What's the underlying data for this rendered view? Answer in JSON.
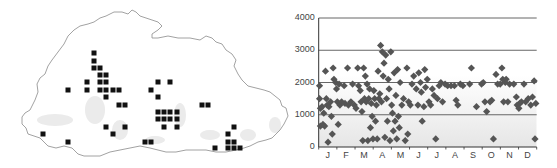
{
  "map": {
    "title": "Distribution map",
    "outline_color": "#8a8a8a",
    "square_color": "#111111",
    "square_size": 5,
    "squares": [
      [
        94,
        53
      ],
      [
        94,
        61
      ],
      [
        94,
        68
      ],
      [
        100,
        68
      ],
      [
        100,
        75
      ],
      [
        106,
        75
      ],
      [
        87,
        82
      ],
      [
        100,
        82
      ],
      [
        106,
        82
      ],
      [
        158,
        82
      ],
      [
        170,
        82
      ],
      [
        68,
        90
      ],
      [
        87,
        90
      ],
      [
        100,
        90
      ],
      [
        106,
        90
      ],
      [
        113,
        90
      ],
      [
        119,
        90
      ],
      [
        151,
        90
      ],
      [
        106,
        97
      ],
      [
        158,
        97
      ],
      [
        119,
        105
      ],
      [
        125,
        105
      ],
      [
        202,
        105
      ],
      [
        208,
        105
      ],
      [
        158,
        112
      ],
      [
        164,
        112
      ],
      [
        170,
        112
      ],
      [
        177,
        112
      ],
      [
        158,
        119
      ],
      [
        164,
        119
      ],
      [
        170,
        119
      ],
      [
        177,
        119
      ],
      [
        106,
        127
      ],
      [
        125,
        127
      ],
      [
        164,
        127
      ],
      [
        177,
        127
      ],
      [
        234,
        127
      ],
      [
        43,
        134
      ],
      [
        113,
        134
      ],
      [
        228,
        134
      ],
      [
        68,
        142
      ],
      [
        145,
        142
      ],
      [
        151,
        142
      ],
      [
        228,
        142
      ],
      [
        234,
        142
      ],
      [
        215,
        148
      ],
      [
        228,
        148
      ],
      [
        234,
        148
      ],
      [
        240,
        148
      ]
    ]
  },
  "chart_data": {
    "type": "scatter",
    "title": "",
    "xlabel": "",
    "ylabel": "",
    "ylim": [
      0,
      4000
    ],
    "yticks": [
      0,
      1000,
      2000,
      3000,
      4000
    ],
    "ytick_labels": [
      "0",
      "1000",
      "2000",
      "3000",
      "4000"
    ],
    "xticks_labels": [
      "J",
      "F",
      "M",
      "A",
      "M",
      "J",
      "J",
      "A",
      "S",
      "O",
      "N",
      "D"
    ],
    "xlim": [
      0,
      12
    ],
    "grid": "horizontal",
    "marker": "diamond",
    "marker_color": "#555555",
    "background": "white above 2000, light grey shading below 2000",
    "points": [
      [
        0.05,
        1900
      ],
      [
        0.05,
        1500
      ],
      [
        0.1,
        1200
      ],
      [
        0.1,
        650
      ],
      [
        0.2,
        1250
      ],
      [
        0.25,
        700
      ],
      [
        0.3,
        1050
      ],
      [
        0.35,
        650
      ],
      [
        0.4,
        2350
      ],
      [
        0.45,
        1500
      ],
      [
        0.5,
        1300
      ],
      [
        0.55,
        150
      ],
      [
        0.6,
        1250
      ],
      [
        0.7,
        1400
      ],
      [
        0.75,
        950
      ],
      [
        0.8,
        400
      ],
      [
        0.85,
        2450
      ],
      [
        0.9,
        2100
      ],
      [
        1.0,
        2000
      ],
      [
        1.05,
        1800
      ],
      [
        1.1,
        1400
      ],
      [
        1.15,
        700
      ],
      [
        1.2,
        1950
      ],
      [
        1.25,
        1300
      ],
      [
        1.35,
        1400
      ],
      [
        1.5,
        1900
      ],
      [
        1.55,
        1350
      ],
      [
        1.7,
        2450
      ],
      [
        1.75,
        1300
      ],
      [
        1.9,
        1400
      ],
      [
        2.0,
        1950
      ],
      [
        2.1,
        1300
      ],
      [
        2.2,
        1200
      ],
      [
        2.3,
        2450
      ],
      [
        2.35,
        1900
      ],
      [
        2.45,
        1750
      ],
      [
        2.5,
        1400
      ],
      [
        2.55,
        1100
      ],
      [
        2.6,
        200
      ],
      [
        2.65,
        2450
      ],
      [
        2.7,
        1500
      ],
      [
        2.75,
        2200
      ],
      [
        2.8,
        1400
      ],
      [
        2.85,
        1950
      ],
      [
        2.9,
        200
      ],
      [
        2.95,
        1500
      ],
      [
        3.0,
        1800
      ],
      [
        3.05,
        600
      ],
      [
        3.1,
        1350
      ],
      [
        3.15,
        950
      ],
      [
        3.2,
        250
      ],
      [
        3.25,
        1750
      ],
      [
        3.3,
        1500
      ],
      [
        3.35,
        800
      ],
      [
        3.4,
        1300
      ],
      [
        3.45,
        250
      ],
      [
        3.5,
        2350
      ],
      [
        3.55,
        1500
      ],
      [
        3.6,
        1650
      ],
      [
        3.65,
        3150
      ],
      [
        3.7,
        1400
      ],
      [
        3.75,
        2950
      ],
      [
        3.8,
        2200
      ],
      [
        3.85,
        2600
      ],
      [
        3.9,
        300
      ],
      [
        3.95,
        2850
      ],
      [
        4.0,
        1500
      ],
      [
        4.05,
        800
      ],
      [
        4.1,
        2100
      ],
      [
        4.15,
        1800
      ],
      [
        4.2,
        200
      ],
      [
        4.25,
        2950
      ],
      [
        4.3,
        1300
      ],
      [
        4.35,
        1050
      ],
      [
        4.4,
        500
      ],
      [
        4.45,
        2300
      ],
      [
        4.5,
        800
      ],
      [
        4.55,
        1600
      ],
      [
        4.6,
        250
      ],
      [
        4.65,
        2400
      ],
      [
        4.7,
        950
      ],
      [
        4.75,
        600
      ],
      [
        4.8,
        2000
      ],
      [
        4.9,
        1300
      ],
      [
        5.0,
        1500
      ],
      [
        5.1,
        200
      ],
      [
        5.2,
        2450
      ],
      [
        5.25,
        400
      ],
      [
        5.3,
        1400
      ],
      [
        5.4,
        1300
      ],
      [
        5.5,
        1950
      ],
      [
        5.6,
        2200
      ],
      [
        5.75,
        1800
      ],
      [
        5.85,
        1300
      ],
      [
        5.9,
        2300
      ],
      [
        6.0,
        2000
      ],
      [
        6.05,
        1700
      ],
      [
        6.1,
        800
      ],
      [
        6.2,
        1250
      ],
      [
        6.25,
        2400
      ],
      [
        6.3,
        1850
      ],
      [
        6.4,
        2100
      ],
      [
        6.5,
        1400
      ],
      [
        6.6,
        1300
      ],
      [
        6.7,
        1800
      ],
      [
        6.8,
        1600
      ],
      [
        6.9,
        250
      ],
      [
        7.0,
        1500
      ],
      [
        7.1,
        1900
      ],
      [
        7.2,
        2000
      ],
      [
        7.3,
        1400
      ],
      [
        7.45,
        1950
      ],
      [
        7.6,
        1900
      ],
      [
        7.8,
        1900
      ],
      [
        8.0,
        1900
      ],
      [
        8.1,
        1450
      ],
      [
        8.2,
        1300
      ],
      [
        8.35,
        1950
      ],
      [
        8.5,
        1900
      ],
      [
        8.9,
        1950
      ],
      [
        9.0,
        2450
      ],
      [
        9.3,
        1250
      ],
      [
        9.6,
        1950
      ],
      [
        9.7,
        2000
      ],
      [
        9.8,
        1400
      ],
      [
        9.9,
        1100
      ],
      [
        10.1,
        1400
      ],
      [
        10.2,
        1450
      ],
      [
        10.3,
        250
      ],
      [
        10.45,
        2250
      ],
      [
        10.55,
        1950
      ],
      [
        10.7,
        1950
      ],
      [
        10.8,
        2450
      ],
      [
        10.85,
        2100
      ],
      [
        10.9,
        1400
      ],
      [
        11.0,
        2000
      ],
      [
        11.05,
        2100
      ],
      [
        11.15,
        1400
      ],
      [
        11.25,
        1950
      ],
      [
        11.5,
        1950
      ],
      [
        11.65,
        1550
      ],
      [
        11.7,
        1300
      ],
      [
        11.8,
        1200
      ],
      [
        11.85,
        1350
      ],
      [
        11.95,
        1400
      ],
      [
        12.1,
        1950
      ],
      [
        12.2,
        1400
      ],
      [
        12.35,
        1500
      ],
      [
        12.5,
        1300
      ],
      [
        12.6,
        1550
      ],
      [
        12.7,
        2050
      ],
      [
        12.75,
        250
      ],
      [
        12.8,
        1350
      ]
    ]
  }
}
